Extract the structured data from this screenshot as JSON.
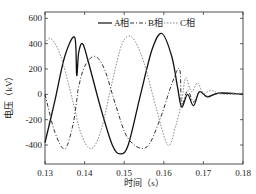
{
  "chart_data": {
    "type": "line",
    "title": "",
    "xlabel": "时间（s）",
    "ylabel": "电压（kV）",
    "xlim": [
      0.13,
      0.18
    ],
    "ylim": [
      -550,
      650
    ],
    "xticks": [
      "0.13",
      "0.14",
      "0.15",
      "0.16",
      "0.17",
      "0.18"
    ],
    "yticks": [
      "600",
      "400",
      "200",
      "0",
      "-200",
      "-400"
    ],
    "legend_position": "top",
    "series": [
      {
        "name": "A相",
        "style": "solid",
        "color": "#111111",
        "x": [
          0.13,
          0.1325,
          0.135,
          0.1375,
          0.138,
          0.1385,
          0.1395,
          0.141,
          0.144,
          0.147,
          0.149,
          0.151,
          0.154,
          0.157,
          0.1595,
          0.162,
          0.1635,
          0.1645,
          0.166,
          0.1675,
          0.169,
          0.171,
          0.174,
          0.18
        ],
        "values": [
          -380,
          -50,
          300,
          450,
          150,
          330,
          400,
          250,
          -100,
          -400,
          -470,
          -400,
          -20,
          350,
          480,
          300,
          50,
          -100,
          0,
          -90,
          20,
          -20,
          10,
          0
        ]
      },
      {
        "name": "B相",
        "style": "dashdot",
        "color": "#333333",
        "x": [
          0.13,
          0.1325,
          0.135,
          0.137,
          0.138,
          0.1385,
          0.14,
          0.1425,
          0.145,
          0.148,
          0.151,
          0.1555,
          0.159,
          0.162,
          0.164,
          0.1645,
          0.166,
          0.1675,
          0.169,
          0.171,
          0.174,
          0.18
        ],
        "values": [
          0,
          -300,
          -430,
          -250,
          -50,
          60,
          220,
          300,
          200,
          -100,
          -350,
          -420,
          -200,
          80,
          200,
          -80,
          30,
          -60,
          20,
          -15,
          10,
          0
        ]
      },
      {
        "name": "C相",
        "style": "dotted",
        "color": "#888888",
        "x": [
          0.13,
          0.1315,
          0.134,
          0.137,
          0.139,
          0.1415,
          0.144,
          0.147,
          0.1495,
          0.152,
          0.155,
          0.158,
          0.161,
          0.163,
          0.1645,
          0.1655,
          0.167,
          0.1685,
          0.17,
          0.172,
          0.175,
          0.18
        ],
        "values": [
          400,
          440,
          300,
          -50,
          -300,
          -430,
          -300,
          100,
          400,
          450,
          250,
          -100,
          -400,
          -250,
          -60,
          130,
          20,
          90,
          10,
          30,
          0,
          10
        ]
      }
    ]
  },
  "legend": {
    "a": "A相",
    "b": "B相",
    "c": "C相"
  },
  "axes": {
    "xlabel": "时间（s）",
    "ylabel": "电压（kV）"
  }
}
